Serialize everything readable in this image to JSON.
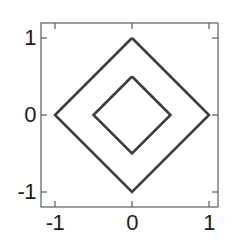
{
  "chart_data": {
    "type": "line",
    "title": "",
    "xlabel": "",
    "ylabel": "",
    "xlim": [
      -1.22,
      1.12
    ],
    "ylim": [
      -1.2,
      1.2
    ],
    "xticks": [
      -1,
      0,
      1
    ],
    "yticks": [
      -1,
      0,
      1
    ],
    "xticklabels": [
      "-1",
      "0",
      "1"
    ],
    "yticklabels": [
      "-1",
      "0",
      "1"
    ],
    "grid": false,
    "legend": null,
    "frame": "box",
    "line_color": "#3d3d3d",
    "line_width": 2.6,
    "series": [
      {
        "name": "outer-diamond",
        "description": "|x| + |y| = 1",
        "level": 1,
        "closed": true,
        "x": [
          0,
          1,
          0,
          -1,
          0
        ],
        "y": [
          1,
          0,
          -1,
          0,
          1
        ]
      },
      {
        "name": "inner-diamond",
        "description": "|x| + |y| = 0.5",
        "level": 0.5,
        "closed": true,
        "x": [
          0,
          0.5,
          0,
          -0.5,
          0
        ],
        "y": [
          0.5,
          0,
          -0.5,
          0,
          0.5
        ]
      }
    ]
  },
  "axes": {
    "x_tick_labels": [
      {
        "value": -1,
        "text": "-1"
      },
      {
        "value": 0,
        "text": "0"
      },
      {
        "value": 1,
        "text": "1"
      }
    ],
    "y_tick_labels": [
      {
        "value": 1,
        "text": "1"
      },
      {
        "value": 0,
        "text": "0"
      },
      {
        "value": -1,
        "text": "-1"
      }
    ]
  },
  "colors": {
    "background": "#ffffff",
    "axis": "#555555",
    "curve": "#3d3d3d",
    "text": "#1c1c1c"
  }
}
